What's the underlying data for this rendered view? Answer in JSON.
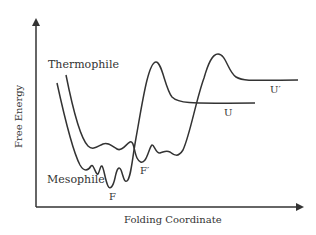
{
  "diagram": {
    "type": "energy-landscape",
    "axes": {
      "y_label": "Free Energy",
      "x_label": "Folding Coordinate"
    },
    "curves": [
      {
        "name": "Thermophile",
        "label": "Thermophile",
        "folded_state_label": "F′",
        "unfolded_state_label": "U′"
      },
      {
        "name": "Mesophile",
        "label": "Mesophile",
        "folded_state_label": "F",
        "unfolded_state_label": "U"
      }
    ],
    "colors": {
      "line": "#333333",
      "background": "#ffffff"
    }
  }
}
